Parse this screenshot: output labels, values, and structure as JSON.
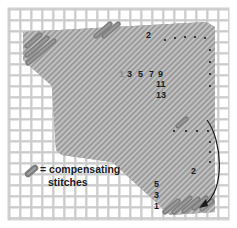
{
  "diagram": {
    "type": "needlepoint-stitch-diagram",
    "canvas": {
      "grid_color": "#d2d2d2",
      "grid_line_color": "#c4c4c4",
      "background": "#ffffff"
    },
    "colors": {
      "stitch": "#b4b4b4",
      "stitch_edge": "#9a9a9a",
      "compensating_stitch": "#8c8c8c",
      "arrow": "#1a1a1a",
      "number": "#1a1a1a"
    },
    "top_sequence_labels": {
      "top_right": "2",
      "row": [
        "3",
        "5",
        "7",
        "9"
      ],
      "column": [
        "11",
        "13"
      ],
      "faded_1": "1"
    },
    "bottom_sequence_labels": {
      "right": "2",
      "column": [
        "5",
        "3",
        "1"
      ]
    },
    "legend": {
      "icon": "compensating-stitch-swatch",
      "line1": "= compensating",
      "line2": "stitches"
    },
    "arrow": {
      "direction": "curved-down",
      "description": "continue pattern downward"
    }
  }
}
